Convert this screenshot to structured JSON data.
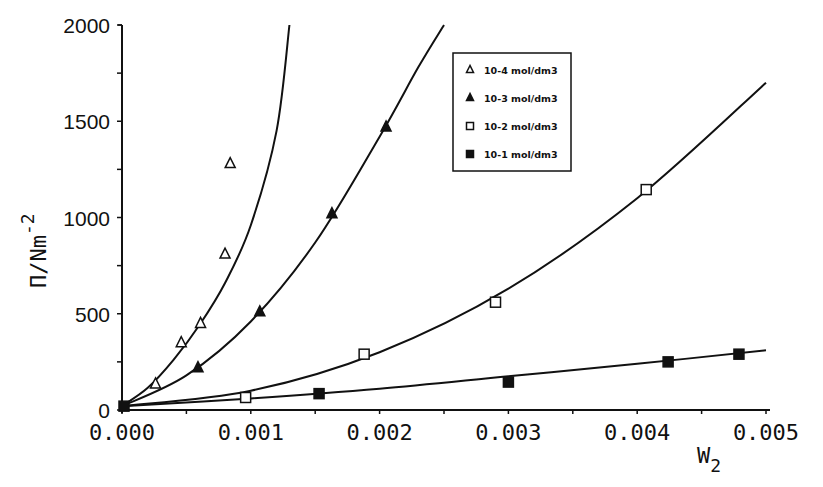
{
  "chart_data": {
    "type": "scatter",
    "title": "",
    "xlabel": "W2",
    "ylabel": "Π / Nm-2",
    "xlim": [
      0.0,
      0.005
    ],
    "ylim": [
      0,
      2000
    ],
    "x_ticks": [
      "0.000",
      "0.001",
      "0.002",
      "0.003",
      "0.004",
      "0.005"
    ],
    "y_ticks": [
      "0",
      "500",
      "1000",
      "1500",
      "2000"
    ],
    "grid": false,
    "legend_position": "upper-right-inside",
    "series": [
      {
        "name": "10-4 mol/dm3",
        "marker": "open-triangle",
        "x": [
          0.0,
          0.00026,
          0.00046,
          0.00061,
          0.0008,
          0.00084
        ],
        "y": [
          20,
          135,
          350,
          450,
          810,
          1280
        ],
        "curve_x": [
          0.0,
          0.0002,
          0.0004,
          0.0006,
          0.0008,
          0.001,
          0.0012,
          0.0013
        ],
        "curve_y": [
          20,
          115,
          260,
          440,
          660,
          960,
          1450,
          2000
        ]
      },
      {
        "name": "10-3 mol/dm3",
        "marker": "filled-triangle",
        "x": [
          0.0,
          0.00059,
          0.00107,
          0.00163,
          0.00205
        ],
        "y": [
          20,
          220,
          510,
          1020,
          1470
        ],
        "curve_x": [
          0.0,
          0.0005,
          0.001,
          0.0015,
          0.002,
          0.0023,
          0.0025
        ],
        "curve_y": [
          20,
          180,
          460,
          870,
          1420,
          1780,
          2000
        ]
      },
      {
        "name": "10-2 mol/dm3",
        "marker": "open-square",
        "x": [
          0.0,
          0.00096,
          0.00188,
          0.0029,
          0.00407
        ],
        "y": [
          20,
          65,
          290,
          560,
          1145
        ],
        "curve_x": [
          0.0,
          0.001,
          0.002,
          0.003,
          0.004,
          0.005
        ],
        "curve_y": [
          20,
          100,
          300,
          630,
          1100,
          1700
        ]
      },
      {
        "name": "10-1 mol/dm3",
        "marker": "filled-square",
        "x": [
          0.0,
          0.00153,
          0.003,
          0.00424,
          0.00479
        ],
        "y": [
          20,
          85,
          145,
          250,
          290
        ],
        "curve_x": [
          0.0,
          0.001,
          0.002,
          0.003,
          0.004,
          0.005
        ],
        "curve_y": [
          20,
          60,
          110,
          175,
          240,
          310
        ]
      }
    ]
  },
  "axes": {
    "ylabel_main": "Π/Nm",
    "ylabel_sup": "-2",
    "xlabel_main": "W",
    "xlabel_sub": "2"
  },
  "legend": [
    {
      "label": "10-4 mol/dm3",
      "marker": "open-triangle"
    },
    {
      "label": "10-3 mol/dm3",
      "marker": "filled-triangle"
    },
    {
      "label": "10-2 mol/dm3",
      "marker": "open-square"
    },
    {
      "label": "10-1 mol/dm3",
      "marker": "filled-square"
    }
  ]
}
